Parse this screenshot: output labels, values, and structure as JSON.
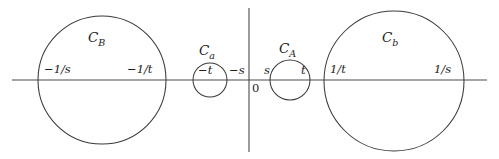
{
  "figure": {
    "stroke_color": "#3a3a3a",
    "axis_color": "#4a4a4a",
    "text_color": "#1a1a1a",
    "background": "#ffffff"
  },
  "axes": {
    "horizontal_label": "",
    "vertical_label": "",
    "origin_label": "0"
  },
  "curves": [
    {
      "id": "C_B",
      "name_main": "C",
      "name_sub": "B",
      "cx": 102,
      "cy": 80,
      "r": 64,
      "left_tick": "−1/s",
      "right_tick": "−1/t"
    },
    {
      "id": "C_a",
      "name_main": "C",
      "name_sub": "a",
      "cx": 210,
      "cy": 80,
      "r": 17,
      "left_tick": "−t",
      "right_tick": "−s"
    },
    {
      "id": "C_A",
      "name_main": "C",
      "name_sub": "A",
      "cx": 290,
      "cy": 80,
      "r": 20,
      "left_tick": "s",
      "right_tick": "t"
    },
    {
      "id": "C_b",
      "name_main": "C",
      "name_sub": "b",
      "cx": 394,
      "cy": 81,
      "r": 70,
      "left_tick": "1/t",
      "right_tick": "1/s"
    }
  ],
  "chart_data": {
    "type": "diagram",
    "title": "",
    "xlabel": "",
    "ylabel": "",
    "grid": false,
    "legend": "none",
    "axis_lines": {
      "horizontal": {
        "y": 80,
        "x_start": 12,
        "x_end": 487
      },
      "vertical": {
        "x": 249,
        "y_start": 8,
        "y_end": 152
      }
    },
    "circles": [
      {
        "label": "C_B",
        "center_x": 102,
        "center_y": 80,
        "radius": 64,
        "x_left_label": "−1/s",
        "x_right_label": "−1/t"
      },
      {
        "label": "C_a",
        "center_x": 210,
        "center_y": 80,
        "radius": 17,
        "x_left_label": "−t",
        "x_right_label": "−s"
      },
      {
        "label": "C_A",
        "center_x": 290,
        "center_y": 80,
        "radius": 20,
        "x_left_label": "s",
        "x_right_label": "t"
      },
      {
        "label": "C_b",
        "center_x": 394,
        "center_y": 81,
        "radius": 70,
        "x_left_label": "1/t",
        "x_right_label": "1/s"
      }
    ],
    "annotations": [
      "0",
      "−1/s",
      "−1/t",
      "−t",
      "−s",
      "s",
      "t",
      "1/t",
      "1/s",
      "C_B",
      "C_a",
      "C_A",
      "C_b"
    ]
  },
  "labels": {
    "cB_tick_left": "−1/s",
    "cB_tick_right": "−1/t",
    "ca_tick_left": "−t",
    "ca_tick_right": "−s",
    "cA_tick_left": "s",
    "cA_tick_right": "t",
    "cb_tick_left": "1/t",
    "cb_tick_right": "1/s",
    "origin": "0",
    "cB_name": "C",
    "cB_sub": "B",
    "ca_name": "C",
    "ca_sub": "a",
    "cA_name": "C",
    "cA_sub": "A",
    "cb_name": "C",
    "cb_sub": "b"
  }
}
